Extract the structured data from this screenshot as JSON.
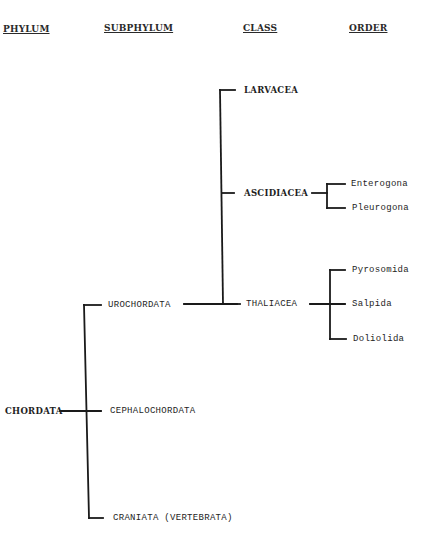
{
  "headers": {
    "phylum": "PHYLUM",
    "subphylum": "SUBPHYLUM",
    "class": "CLASS",
    "order": "ORDER"
  },
  "tree": {
    "phylum": "CHORDATA",
    "subphyla": {
      "urochordata": "UROCHORDATA",
      "cephalochordata": "CEPHALOCHORDATA",
      "craniata": "CRANIATA (VERTEBRATA)"
    },
    "classes": {
      "larvacea": "LARVACEA",
      "ascidiacea": "ASCIDIACEA",
      "thaliacea": "THALIACEA"
    },
    "orders": {
      "enterogona": "Enterogona",
      "pleurogona": "Pleurogona",
      "pyrosomida": "Pyrosomida",
      "salpida": "Salpida",
      "doliolida": "Doliolida"
    }
  }
}
